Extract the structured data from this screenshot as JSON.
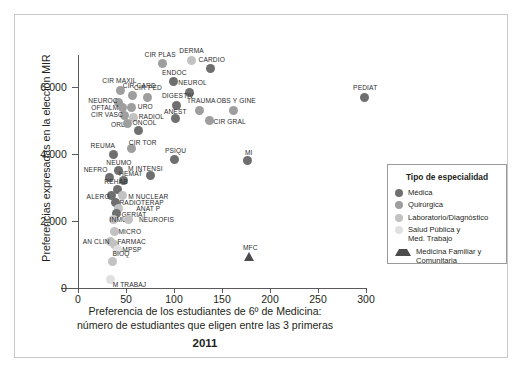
{
  "figure": {
    "frame_color": "#c9c9c9",
    "background": "#ffffff"
  },
  "axes": {
    "y_title": "Preferencias expresadas en la elección MIR",
    "x_title_line1": "Preferencia de los estudiantes de 6º de Medicina:",
    "x_title_line2": "número de estudiantes que eligen entre las 3 primeras",
    "year": "2011",
    "y_ticks": [
      "6.000",
      "4.000",
      "2.000",
      "0"
    ],
    "x_ticks": [
      "0",
      "50",
      "100",
      "150",
      "200",
      "250",
      "300"
    ]
  },
  "legend": {
    "title": "Tipo de especialidad",
    "items": [
      {
        "label": "Médica",
        "color": "#6f6f6f",
        "shape": "circle"
      },
      {
        "label": "Quirúrgica",
        "color": "#9e9e9e",
        "shape": "circle"
      },
      {
        "label": "Laboratorio/Diagnóstico",
        "color": "#c2c2c2",
        "shape": "circle"
      },
      {
        "label": "Salud Pública y\nMed. Trabajo",
        "color": "#e0e0e0",
        "shape": "circle"
      },
      {
        "label": "Medicina Familiar y\nComunitaria",
        "color": "#4c4c4c",
        "shape": "triangle"
      }
    ]
  },
  "chart_data": {
    "type": "scatter",
    "title": "",
    "xlabel": "Preferencia de los estudiantes de 6º de Medicina: número de estudiantes que eligen entre las 3 primeras",
    "ylabel": "Preferencias expresadas en la elección MIR",
    "xlim": [
      0,
      310
    ],
    "ylim": [
      0,
      7100
    ],
    "grid": false,
    "legend_position": "right",
    "categories": [
      "Médica",
      "Quirúrgica",
      "Laboratorio/Diagnóstico",
      "Salud Pública y Med. Trabajo",
      "Medicina Familiar y Comunitaria"
    ],
    "points": [
      {
        "label": "CIR PLAS",
        "x": 88,
        "y": 6700,
        "group": "Quirúrgica",
        "lx": -18,
        "ly": -13
      },
      {
        "label": "DERMA",
        "x": 118,
        "y": 6800,
        "group": "Laboratorio/Diagnóstico",
        "lx": -12,
        "ly": -13
      },
      {
        "label": "CARDIO",
        "x": 138,
        "y": 6550,
        "group": "Médica",
        "lx": -12,
        "ly": -13
      },
      {
        "label": "ENDOC",
        "x": 99,
        "y": 6150,
        "group": "Médica",
        "lx": -11,
        "ly": -13
      },
      {
        "label": "NEUROL",
        "x": 116,
        "y": 5850,
        "group": "Médica",
        "lx": -11,
        "ly": -13
      },
      {
        "label": "CIR MAXIL",
        "x": 44,
        "y": 5900,
        "group": "Quirúrgica",
        "lx": -18,
        "ly": -13
      },
      {
        "label": "CIR CARD",
        "x": 57,
        "y": 5750,
        "group": "Quirúrgica",
        "lx": -10,
        "ly": -13
      },
      {
        "label": "CIR PED",
        "x": 72,
        "y": 5700,
        "group": "Quirúrgica",
        "lx": -13,
        "ly": -13
      },
      {
        "label": "DIGESTIV",
        "x": 103,
        "y": 5450,
        "group": "Médica",
        "lx": -15,
        "ly": -13
      },
      {
        "label": "NEUROC",
        "x": 42,
        "y": 5550,
        "group": "Quirúrgica",
        "lx": -30,
        "ly": -5
      },
      {
        "label": "OFTALM",
        "x": 46,
        "y": 5380,
        "group": "Quirúrgica",
        "lx": -31,
        "ly": -4
      },
      {
        "label": "URO",
        "x": 56,
        "y": 5400,
        "group": "Quirúrgica",
        "lx": 6,
        "ly": -4
      },
      {
        "label": "TRAUMA",
        "x": 127,
        "y": 5300,
        "group": "Quirúrgica",
        "lx": -13,
        "ly": -13
      },
      {
        "label": "OBS Y GINE",
        "x": 162,
        "y": 5300,
        "group": "Quirúrgica",
        "lx": -17,
        "ly": -13
      },
      {
        "label": "CIR VASC",
        "x": 48,
        "y": 5150,
        "group": "Quirúrgica",
        "lx": -33,
        "ly": -4
      },
      {
        "label": "RADIOL",
        "x": 58,
        "y": 5100,
        "group": "Laboratorio/Diagnóstico",
        "lx": 5,
        "ly": -4
      },
      {
        "label": "ANEST",
        "x": 102,
        "y": 5050,
        "group": "Médica",
        "lx": -12,
        "ly": -11
      },
      {
        "label": "CIR GRAL",
        "x": 137,
        "y": 5000,
        "group": "Quirúrgica",
        "lx": 4,
        "ly": -3
      },
      {
        "label": "ORL",
        "x": 52,
        "y": 4900,
        "group": "Quirúrgica",
        "lx": -17,
        "ly": -3
      },
      {
        "label": "ONCOL",
        "x": 63,
        "y": 4700,
        "group": "Médica",
        "lx": -6,
        "ly": -12
      },
      {
        "label": "REUMA",
        "x": 37,
        "y": 4000,
        "group": "Médica",
        "lx": -23,
        "ly": -12
      },
      {
        "label": "CIR TOR",
        "x": 56,
        "y": 4150,
        "group": "Quirúrgica",
        "lx": -3,
        "ly": -10
      },
      {
        "label": "PSIQU",
        "x": 101,
        "y": 3850,
        "group": "Médica",
        "lx": -10,
        "ly": -12
      },
      {
        "label": "MI",
        "x": 177,
        "y": 3800,
        "group": "Médica",
        "lx": -3,
        "ly": -12
      },
      {
        "label": "NEUMO",
        "x": 42,
        "y": 3500,
        "group": "Médica",
        "lx": -12,
        "ly": -12
      },
      {
        "label": "M INTENSI",
        "x": 75,
        "y": 3350,
        "group": "Médica",
        "lx": -22,
        "ly": -11
      },
      {
        "label": "NEFRO",
        "x": 33,
        "y": 3300,
        "group": "Médica",
        "lx": -26,
        "ly": -11
      },
      {
        "label": "HEMAT",
        "x": 47,
        "y": 3200,
        "group": "Médica",
        "lx": -4,
        "ly": -11
      },
      {
        "label": "REHAB",
        "x": 41,
        "y": 2950,
        "group": "Médica",
        "lx": -13,
        "ly": -11
      },
      {
        "label": "ALERG",
        "x": 35,
        "y": 2750,
        "group": "Médica",
        "lx": -25,
        "ly": -3
      },
      {
        "label": "M NUCLEAR",
        "x": 46,
        "y": 2750,
        "group": "Laboratorio/Diagnóstico",
        "lx": 6,
        "ly": -3
      },
      {
        "label": "RADIOTERAP",
        "x": 39,
        "y": 2550,
        "group": "Médica",
        "lx": 4,
        "ly": -4
      },
      {
        "label": "ANAT P",
        "x": 42,
        "y": 2380,
        "group": "Laboratorio/Diagnóstico",
        "lx": 18,
        "ly": -3
      },
      {
        "label": "GERIAT",
        "x": 40,
        "y": 2220,
        "group": "Médica",
        "lx": 5,
        "ly": -3
      },
      {
        "label": "INMUN",
        "x": 37,
        "y": 2050,
        "group": "Laboratorio/Diagnóstico",
        "lx": -4,
        "ly": -3
      },
      {
        "label": "NEUROFIS",
        "x": 53,
        "y": 2050,
        "group": "Laboratorio/Diagnóstico",
        "lx": 10,
        "ly": -3
      },
      {
        "label": "MICRO",
        "x": 38,
        "y": 1700,
        "group": "Laboratorio/Diagnóstico",
        "lx": 4,
        "ly": -3
      },
      {
        "label": "AN CLIN",
        "x": 34,
        "y": 1400,
        "group": "Laboratorio/Diagnóstico",
        "lx": -28,
        "ly": -3
      },
      {
        "label": "FARMAC",
        "x": 38,
        "y": 1300,
        "group": "Laboratorio/Diagnóstico",
        "lx": 3,
        "ly": -6
      },
      {
        "label": "MPSP",
        "x": 41,
        "y": 1150,
        "group": "Salud Pública y Med. Trabajo",
        "lx": 5,
        "ly": -3
      },
      {
        "label": "BIOQ",
        "x": 36,
        "y": 800,
        "group": "Laboratorio/Diagnóstico",
        "lx": 0,
        "ly": -11
      },
      {
        "label": "M TRABAJ",
        "x": 34,
        "y": 250,
        "group": "Salud Pública y Med. Trabajo",
        "lx": 2,
        "ly": 1
      },
      {
        "label": "PEDIAT",
        "x": 298,
        "y": 5700,
        "group": "Médica",
        "lx": -11,
        "ly": -13
      },
      {
        "label": "MFC",
        "x": 178,
        "y": 930,
        "group": "Medicina Familiar y Comunitaria",
        "lx": -6,
        "ly": -13
      }
    ]
  }
}
